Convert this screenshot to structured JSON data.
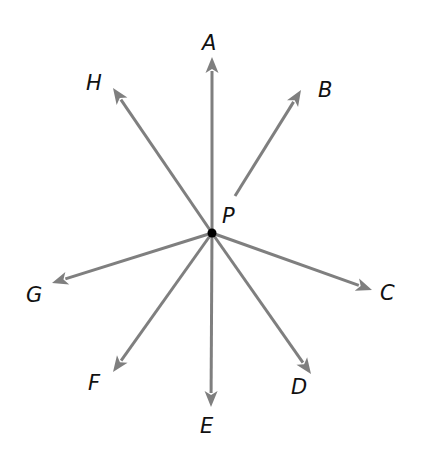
{
  "diagram": {
    "type": "rays from a common point",
    "center": {
      "label": "P",
      "x": 212,
      "y": 233
    },
    "colors": {
      "ray": "#7f7f7f",
      "point": "#000000",
      "label": "#111111"
    },
    "rays": [
      {
        "label": "A",
        "tip": [
          212,
          57
        ],
        "label_pos": [
          202,
          50
        ]
      },
      {
        "label": "B",
        "tip": [
          301,
          90
        ],
        "label_pos": [
          318,
          97
        ],
        "start": [
          235,
          196
        ]
      },
      {
        "label": "C",
        "tip": [
          372,
          290
        ],
        "label_pos": [
          380,
          300
        ]
      },
      {
        "label": "D",
        "tip": [
          311,
          374
        ],
        "label_pos": [
          291,
          394
        ]
      },
      {
        "label": "E",
        "tip": [
          211,
          407
        ],
        "label_pos": [
          200,
          433
        ]
      },
      {
        "label": "F",
        "tip": [
          113,
          372
        ],
        "label_pos": [
          88,
          390
        ]
      },
      {
        "label": "G",
        "tip": [
          52,
          283
        ],
        "label_pos": [
          26,
          302
        ]
      },
      {
        "label": "H",
        "tip": [
          113,
          88
        ],
        "label_pos": [
          86,
          90
        ]
      }
    ]
  }
}
